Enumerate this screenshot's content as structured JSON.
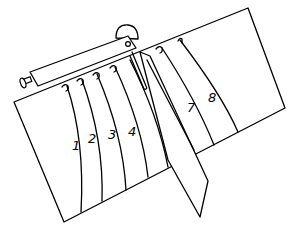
{
  "diagram": {
    "strip_labels": [
      "1",
      "2",
      "3",
      "4",
      "7",
      "8"
    ],
    "colors": {
      "stroke": "#000000",
      "background": "#ffffff"
    }
  }
}
